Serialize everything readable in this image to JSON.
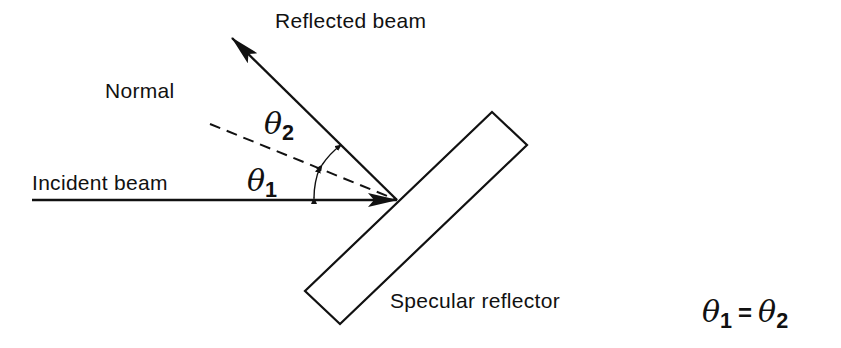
{
  "diagram": {
    "labels": {
      "reflected_beam": "Reflected beam",
      "normal": "Normal",
      "incident_beam": "Incident beam",
      "specular_reflector": "Specular reflector"
    },
    "angles": {
      "theta1": {
        "symbol": "θ",
        "subscript": "1"
      },
      "theta2": {
        "symbol": "θ",
        "subscript": "2"
      }
    },
    "equation": {
      "lhs_symbol": "θ",
      "lhs_subscript": "1",
      "operator": "=",
      "rhs_symbol": "θ",
      "rhs_subscript": "2"
    },
    "colors": {
      "ink": "#111111",
      "background": "#ffffff"
    }
  }
}
